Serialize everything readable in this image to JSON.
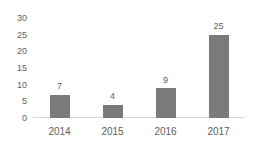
{
  "chart_data": {
    "type": "bar",
    "title": "",
    "subtitle": "",
    "xlabel": "",
    "ylabel": "",
    "categories": [
      "2014",
      "2015",
      "2016",
      "2017"
    ],
    "values": [
      7,
      4,
      9,
      25
    ],
    "data_labels": [
      "7",
      "4",
      "9",
      "25"
    ],
    "ylim": [
      0,
      30
    ],
    "ytick_step": 5,
    "yticks": [
      "0",
      "5",
      "10",
      "15",
      "20",
      "25",
      "30"
    ],
    "grid": false,
    "legend": false,
    "legend_position": "none",
    "bar_color": "#7a7a7a",
    "text_color": "#5e5e5e",
    "axis_color": "#d9d9d9",
    "background_color": "#ffffff"
  }
}
